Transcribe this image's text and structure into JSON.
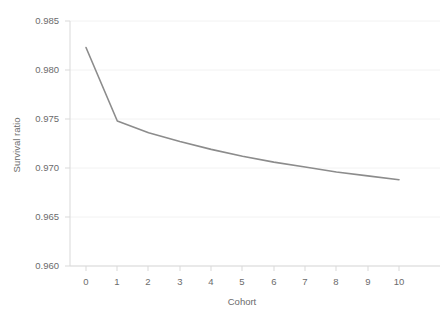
{
  "chart_data": {
    "type": "line",
    "title": "",
    "xlabel": "Cohort",
    "ylabel": "Survival ratio",
    "x": [
      0,
      1,
      2,
      3,
      4,
      5,
      6,
      7,
      8,
      9,
      10
    ],
    "categories": [
      "0",
      "1",
      "2",
      "3",
      "4",
      "5",
      "6",
      "7",
      "8",
      "9",
      "10"
    ],
    "values": [
      0.9823,
      0.9748,
      0.9736,
      0.9727,
      0.9719,
      0.9712,
      0.9706,
      0.9701,
      0.9696,
      0.9692,
      0.9688
    ],
    "series": [
      {
        "name": "Survival ratio",
        "values": [
          0.9823,
          0.9748,
          0.9736,
          0.9727,
          0.9719,
          0.9712,
          0.9706,
          0.9701,
          0.9696,
          0.9692,
          0.9688
        ],
        "color": "#8c8c8c"
      }
    ],
    "xlim": [
      0,
      10
    ],
    "ylim": [
      0.96,
      0.985
    ],
    "xticks": [
      0,
      1,
      2,
      3,
      4,
      5,
      6,
      7,
      8,
      9,
      10
    ],
    "xticklabels": [
      "0",
      "1",
      "2",
      "3",
      "4",
      "5",
      "6",
      "7",
      "8",
      "9",
      "10"
    ],
    "yticks": [
      0.96,
      0.965,
      0.97,
      0.975,
      0.98,
      0.985
    ],
    "yticklabels": [
      "0.960",
      "0.965",
      "0.970",
      "0.975",
      "0.980",
      "0.985"
    ],
    "grid": true,
    "grid_axis": "y",
    "grid_color": "#f2f2f2",
    "legend": false,
    "legend_position": "none",
    "markers": false,
    "line_color": "#8c8c8c",
    "line_width": 1.6,
    "axis_color": "#d9d9d9",
    "background": "#ffffff",
    "tick_label_color": "#6b6b6b"
  },
  "labels": {
    "y_tick_0": "0.960",
    "y_tick_1": "0.965",
    "y_tick_2": "0.970",
    "y_tick_3": "0.975",
    "y_tick_4": "0.980",
    "y_tick_5": "0.985",
    "x_tick_0": "0",
    "x_tick_1": "1",
    "x_tick_2": "2",
    "x_tick_3": "3",
    "x_tick_4": "4",
    "x_tick_5": "5",
    "x_tick_6": "6",
    "x_tick_7": "7",
    "x_tick_8": "8",
    "x_tick_9": "9",
    "x_tick_10": "10",
    "x_axis_title": "Cohort",
    "y_axis_title": "Survival ratio"
  }
}
